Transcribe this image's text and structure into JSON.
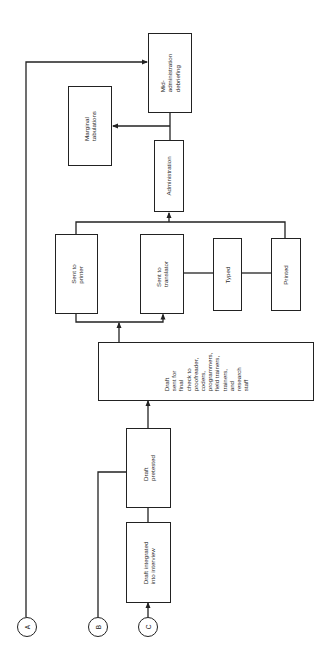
{
  "diagram": {
    "orientation": "rotated-90-ccw",
    "nodes": {
      "mid_admin": {
        "label": "Mid-\nadministration\ndebriefing"
      },
      "marginal": {
        "label": "Marginal\ntabulations"
      },
      "administration": {
        "label": "Administration"
      },
      "sent_printer": {
        "label": "Sent to\nprinter"
      },
      "sent_translator": {
        "label": "Sent to\ntranslator"
      },
      "typed": {
        "label": "Typed"
      },
      "printed": {
        "label": "Printed"
      },
      "final_check": {
        "label": "Draft\nsent for\nfinal\ncheck to\nproofreader,\ncoders,\nprogrammers,\nfield trainers,\ntrainers,\nand\nresearch\nstaff"
      },
      "pretested": {
        "label": "Draft\npretested"
      },
      "integrated": {
        "label": "Draft integrated\ninto interview"
      }
    },
    "connectors": {
      "a": {
        "label": "A"
      },
      "b": {
        "label": "B"
      },
      "c": {
        "label": "C"
      }
    },
    "edges": [
      {
        "from": "C",
        "to": "integrated"
      },
      {
        "from": "integrated",
        "to": "pretested"
      },
      {
        "from": "B",
        "to": "pretested"
      },
      {
        "from": "pretested",
        "to": "final_check"
      },
      {
        "from": "final_check",
        "to": "sent_printer"
      },
      {
        "from": "final_check",
        "to": "sent_translator"
      },
      {
        "from": "sent_translator",
        "to": "typed"
      },
      {
        "from": "typed",
        "to": "printed"
      },
      {
        "from": "sent_printer",
        "to": "administration"
      },
      {
        "from": "printed",
        "to": "administration"
      },
      {
        "from": "administration",
        "to": "mid_admin"
      },
      {
        "from": "administration",
        "to": "marginal"
      },
      {
        "from": "A",
        "to": "mid_admin"
      }
    ],
    "colors": {
      "line": "#222222",
      "background": "#ffffff",
      "text": "#2a2a2a"
    }
  }
}
